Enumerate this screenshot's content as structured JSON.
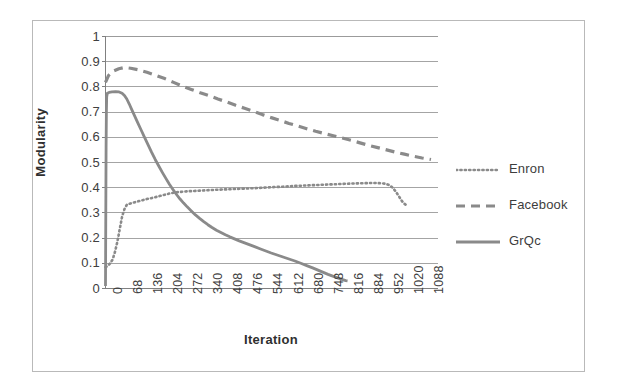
{
  "chart_data": {
    "type": "line",
    "title": "",
    "xlabel": "Iteration",
    "ylabel": "Modularity",
    "xlim": [
      0,
      1122
    ],
    "ylim": [
      0,
      1
    ],
    "grid": true,
    "legend_position": "right",
    "x_ticks": [
      "0",
      "68",
      "136",
      "204",
      "272",
      "340",
      "408",
      "476",
      "544",
      "612",
      "680",
      "748",
      "816",
      "884",
      "952",
      "1020",
      "1088"
    ],
    "y_ticks": [
      "0",
      "0.1",
      "0.2",
      "0.3",
      "0.4",
      "0.5",
      "0.6",
      "0.7",
      "0.8",
      "0.9",
      "1"
    ],
    "series": [
      {
        "name": "Enron",
        "style": "dotted",
        "color": "#8a8a8a",
        "points": [
          [
            0,
            0.085
          ],
          [
            8,
            0.09
          ],
          [
            16,
            0.1
          ],
          [
            24,
            0.115
          ],
          [
            32,
            0.145
          ],
          [
            40,
            0.185
          ],
          [
            48,
            0.235
          ],
          [
            56,
            0.285
          ],
          [
            64,
            0.315
          ],
          [
            72,
            0.332
          ],
          [
            88,
            0.339
          ],
          [
            104,
            0.344
          ],
          [
            120,
            0.349
          ],
          [
            140,
            0.355
          ],
          [
            160,
            0.36
          ],
          [
            180,
            0.366
          ],
          [
            200,
            0.372
          ],
          [
            220,
            0.378
          ],
          [
            240,
            0.382
          ],
          [
            260,
            0.384
          ],
          [
            280,
            0.386
          ],
          [
            300,
            0.387
          ],
          [
            330,
            0.389
          ],
          [
            360,
            0.391
          ],
          [
            400,
            0.393
          ],
          [
            440,
            0.395
          ],
          [
            480,
            0.397
          ],
          [
            520,
            0.399
          ],
          [
            560,
            0.402
          ],
          [
            600,
            0.404
          ],
          [
            640,
            0.407
          ],
          [
            680,
            0.409
          ],
          [
            720,
            0.411
          ],
          [
            760,
            0.413
          ],
          [
            800,
            0.415
          ],
          [
            840,
            0.417
          ],
          [
            880,
            0.418
          ],
          [
            905,
            0.419
          ],
          [
            925,
            0.418
          ],
          [
            945,
            0.416
          ],
          [
            960,
            0.41
          ],
          [
            972,
            0.398
          ],
          [
            982,
            0.383
          ],
          [
            992,
            0.365
          ],
          [
            1000,
            0.35
          ],
          [
            1008,
            0.338
          ],
          [
            1014,
            0.333
          ]
        ]
      },
      {
        "name": "Facebook",
        "style": "dashed",
        "color": "#8a8a8a",
        "points": [
          [
            0,
            0.818
          ],
          [
            10,
            0.845
          ],
          [
            25,
            0.862
          ],
          [
            45,
            0.872
          ],
          [
            65,
            0.877
          ],
          [
            85,
            0.874
          ],
          [
            110,
            0.868
          ],
          [
            140,
            0.858
          ],
          [
            170,
            0.846
          ],
          [
            200,
            0.833
          ],
          [
            230,
            0.818
          ],
          [
            260,
            0.803
          ],
          [
            290,
            0.79
          ],
          [
            320,
            0.777
          ],
          [
            350,
            0.765
          ],
          [
            380,
            0.752
          ],
          [
            410,
            0.74
          ],
          [
            440,
            0.727
          ],
          [
            470,
            0.715
          ],
          [
            500,
            0.703
          ],
          [
            530,
            0.69
          ],
          [
            560,
            0.678
          ],
          [
            590,
            0.667
          ],
          [
            620,
            0.655
          ],
          [
            650,
            0.645
          ],
          [
            680,
            0.634
          ],
          [
            710,
            0.624
          ],
          [
            740,
            0.615
          ],
          [
            770,
            0.606
          ],
          [
            800,
            0.597
          ],
          [
            830,
            0.588
          ],
          [
            860,
            0.578
          ],
          [
            890,
            0.568
          ],
          [
            920,
            0.559
          ],
          [
            950,
            0.55
          ],
          [
            980,
            0.541
          ],
          [
            1010,
            0.533
          ],
          [
            1040,
            0.525
          ],
          [
            1070,
            0.518
          ],
          [
            1100,
            0.512
          ]
        ]
      },
      {
        "name": "GrQc",
        "style": "solid",
        "color": "#8a8a8a",
        "points": [
          [
            0,
            0.01
          ],
          [
            1,
            0.3
          ],
          [
            2,
            0.56
          ],
          [
            3,
            0.7
          ],
          [
            4,
            0.76
          ],
          [
            6,
            0.775
          ],
          [
            12,
            0.778
          ],
          [
            22,
            0.78
          ],
          [
            34,
            0.781
          ],
          [
            46,
            0.78
          ],
          [
            56,
            0.775
          ],
          [
            64,
            0.766
          ],
          [
            72,
            0.752
          ],
          [
            80,
            0.733
          ],
          [
            88,
            0.712
          ],
          [
            98,
            0.686
          ],
          [
            108,
            0.66
          ],
          [
            120,
            0.63
          ],
          [
            132,
            0.6
          ],
          [
            144,
            0.57
          ],
          [
            156,
            0.54
          ],
          [
            168,
            0.512
          ],
          [
            180,
            0.486
          ],
          [
            192,
            0.461
          ],
          [
            204,
            0.437
          ],
          [
            216,
            0.414
          ],
          [
            228,
            0.393
          ],
          [
            240,
            0.373
          ],
          [
            252,
            0.355
          ],
          [
            264,
            0.339
          ],
          [
            276,
            0.324
          ],
          [
            290,
            0.308
          ],
          [
            304,
            0.292
          ],
          [
            318,
            0.278
          ],
          [
            332,
            0.265
          ],
          [
            346,
            0.253
          ],
          [
            360,
            0.242
          ],
          [
            375,
            0.231
          ],
          [
            390,
            0.222
          ],
          [
            405,
            0.213
          ],
          [
            420,
            0.205
          ],
          [
            436,
            0.197
          ],
          [
            452,
            0.189
          ],
          [
            470,
            0.181
          ],
          [
            488,
            0.173
          ],
          [
            506,
            0.165
          ],
          [
            524,
            0.157
          ],
          [
            542,
            0.149
          ],
          [
            560,
            0.141
          ],
          [
            580,
            0.133
          ],
          [
            600,
            0.125
          ],
          [
            620,
            0.117
          ],
          [
            640,
            0.109
          ],
          [
            660,
            0.1
          ],
          [
            680,
            0.091
          ],
          [
            700,
            0.082
          ],
          [
            718,
            0.073
          ],
          [
            736,
            0.064
          ],
          [
            752,
            0.056
          ],
          [
            768,
            0.049
          ],
          [
            782,
            0.043
          ],
          [
            794,
            0.038
          ],
          [
            804,
            0.034
          ],
          [
            812,
            0.031
          ],
          [
            818,
            0.03
          ]
        ]
      }
    ]
  },
  "legend": {
    "items": [
      {
        "label": "Enron",
        "style": "dotted"
      },
      {
        "label": "Facebook",
        "style": "dashed"
      },
      {
        "label": "GrQc",
        "style": "solid"
      }
    ]
  },
  "colors": {
    "series": "#8a8a8a",
    "gridline": "#9a9a9a",
    "axis": "#808080",
    "frame": "#b9b9b9",
    "text": "#3d3d3d"
  }
}
